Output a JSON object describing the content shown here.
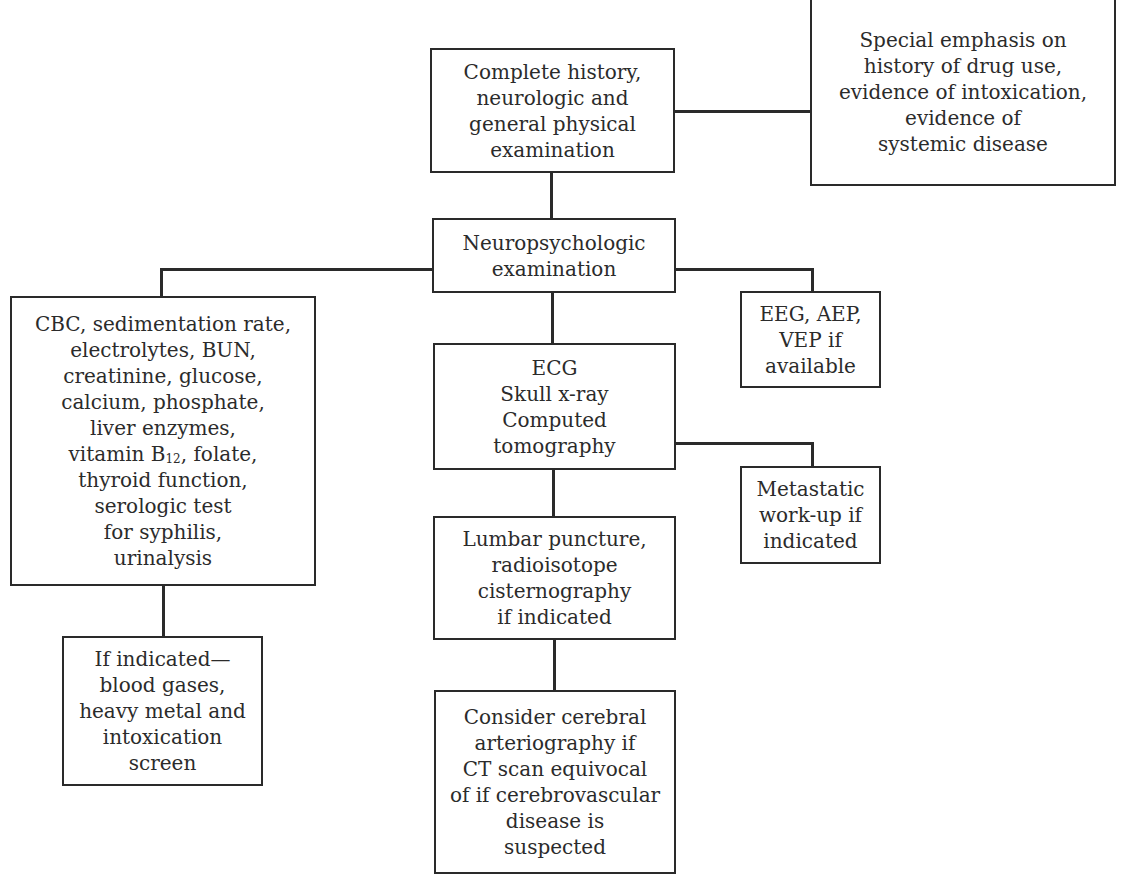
{
  "diagram": {
    "type": "flowchart",
    "nodes": {
      "history": {
        "lines": [
          "Complete history,",
          "neurologic and",
          "general physical",
          "examination"
        ]
      },
      "special_emphasis": {
        "lines": [
          "Special emphasis on",
          "history of drug use,",
          "evidence of intoxication,",
          "evidence of",
          "systemic disease"
        ]
      },
      "neuropsych": {
        "lines": [
          "Neuropsychologic",
          "examination"
        ]
      },
      "labs": {
        "lines": [
          "CBC, sedimentation rate,",
          "electrolytes, BUN,",
          "creatinine, glucose,",
          "calcium, phosphate,",
          "liver enzymes,",
          "vitamin B",
          "thyroid function,",
          "serologic test",
          "for syphilis,",
          "urinalysis"
        ],
        "vitamin_prefix": "vitamin B",
        "vitamin_sub": "12",
        "vitamin_suffix": ", folate,"
      },
      "imaging": {
        "lines": [
          "ECG",
          "Skull x-ray",
          "Computed",
          "tomography"
        ]
      },
      "eeg": {
        "lines": [
          "EEG, AEP,",
          "VEP if",
          "available"
        ]
      },
      "metastatic": {
        "lines": [
          "Metastatic",
          "work-up if",
          "indicated"
        ]
      },
      "lumbar": {
        "lines": [
          "Lumbar puncture,",
          "radioisotope",
          "cisternography",
          "if indicated"
        ]
      },
      "if_indicated": {
        "lines": [
          "If indicated—",
          "blood gases,",
          "heavy metal and",
          "intoxication",
          "screen"
        ]
      },
      "arteriography": {
        "lines": [
          "Consider cerebral",
          "arteriography if",
          "CT scan equivocal",
          "of if cerebrovascular",
          "disease is",
          "suspected"
        ]
      }
    },
    "edges": [
      {
        "from": "history",
        "to": "special_emphasis"
      },
      {
        "from": "history",
        "to": "neuropsych"
      },
      {
        "from": "neuropsych",
        "to": "labs"
      },
      {
        "from": "neuropsych",
        "to": "eeg"
      },
      {
        "from": "neuropsych",
        "to": "imaging"
      },
      {
        "from": "imaging",
        "to": "metastatic"
      },
      {
        "from": "imaging",
        "to": "lumbar"
      },
      {
        "from": "labs",
        "to": "if_indicated"
      },
      {
        "from": "lumbar",
        "to": "arteriography"
      }
    ],
    "colors": {
      "line": "#2a2a2a",
      "text": "#2b2b2b",
      "background": "#ffffff"
    }
  }
}
